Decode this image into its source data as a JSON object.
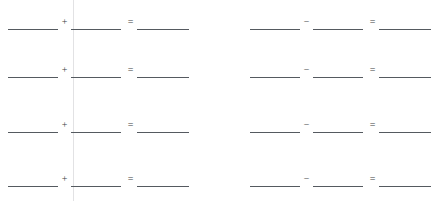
{
  "worksheet": {
    "title": "Blank arithmetic practice worksheet",
    "width": 437,
    "height": 201,
    "background_color": "#ffffff",
    "rule_color": "#555a60",
    "divider_color": "#e2e2e4",
    "blank_value": "",
    "columns": [
      {
        "name": "addition-column",
        "operator": "+",
        "operator_name": "plus-sign",
        "equals": "=",
        "rows": [
          {
            "operand_a": "",
            "operand_b": "",
            "result": ""
          },
          {
            "operand_a": "",
            "operand_b": "",
            "result": ""
          },
          {
            "operand_a": "",
            "operand_b": "",
            "result": ""
          },
          {
            "operand_a": "",
            "operand_b": "",
            "result": ""
          }
        ]
      },
      {
        "name": "subtraction-column",
        "operator": "−",
        "operator_name": "minus-sign",
        "equals": "=",
        "rows": [
          {
            "operand_a": "",
            "operand_b": "",
            "result": ""
          },
          {
            "operand_a": "",
            "operand_b": "",
            "result": ""
          },
          {
            "operand_a": "",
            "operand_b": "",
            "result": ""
          },
          {
            "operand_a": "",
            "operand_b": "",
            "result": ""
          }
        ]
      }
    ]
  }
}
